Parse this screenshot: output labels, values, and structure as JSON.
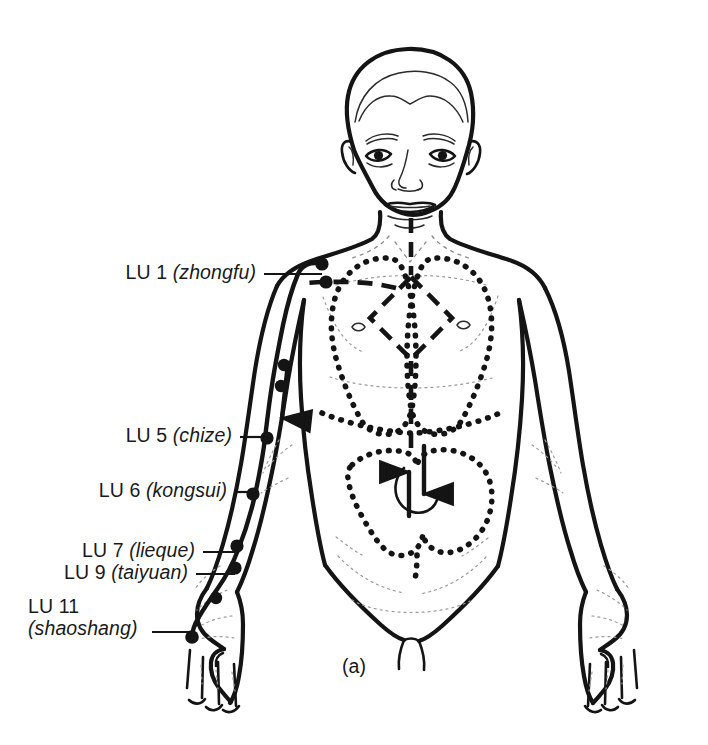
{
  "figure": {
    "caption": "(a)",
    "title_alt": "Lung meridian (LU) acupoints on anterior body",
    "ink_color": "#141414",
    "background_color": "#ffffff"
  },
  "labels": [
    {
      "id": "lu1",
      "code": "LU 1",
      "pinyin": "(zhongfu)",
      "text": "LU 1 (zhongfu)",
      "multiline": false
    },
    {
      "id": "lu5",
      "code": "LU 5",
      "pinyin": "(chize)",
      "text": "LU 5 (chize)",
      "multiline": false
    },
    {
      "id": "lu6",
      "code": "LU 6",
      "pinyin": "(kongsui)",
      "text": "LU 6 (kongsui)",
      "multiline": false
    },
    {
      "id": "lu7",
      "code": "LU 7",
      "pinyin": "(lieque)",
      "text": "LU 7 (lieque)",
      "multiline": false
    },
    {
      "id": "lu9",
      "code": "LU 9",
      "pinyin": "(taiyuan)",
      "text": "LU 9 (taiyuan)",
      "multiline": false
    },
    {
      "id": "lu11",
      "code": "LU 11",
      "pinyin": "(shaoshang)",
      "text": "LU 11 (shaoshang)",
      "multiline": true
    }
  ],
  "diagram": {
    "meridian_name": "lung-meridian",
    "meridian_side": "figure left arm (viewer left)",
    "acupoint_count_marked": 8,
    "internal_pathway_style": "dashed",
    "organ_outline_style": "dotted",
    "organs_outlined": [
      "lung-left",
      "lung-right",
      "diaphragm",
      "large-intestine",
      "stomach"
    ],
    "flow_arrows": [
      "arm-downward",
      "chest-downward",
      "abdomen-upward"
    ]
  }
}
